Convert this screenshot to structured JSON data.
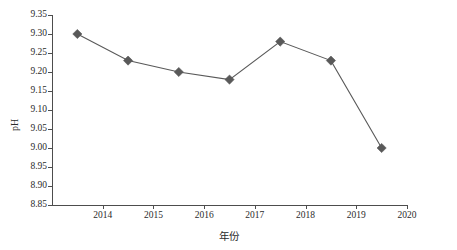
{
  "chart_data": {
    "type": "line",
    "title": "",
    "subtitle": "",
    "xlabel": "年份",
    "ylabel": "pH",
    "x": [
      2013.5,
      2014.5,
      2015.5,
      2016.5,
      2017.5,
      2018.5,
      2019.5
    ],
    "values": [
      9.3,
      9.23,
      9.2,
      9.18,
      9.28,
      9.23,
      9.0
    ],
    "series": [
      {
        "name": "pH",
        "values": [
          9.3,
          9.23,
          9.2,
          9.18,
          9.28,
          9.23,
          9.0
        ]
      }
    ],
    "xlim": [
      2013.0,
      2020.0
    ],
    "ylim": [
      8.85,
      9.35
    ],
    "xticks": [
      2014,
      2015,
      2016,
      2017,
      2018,
      2019,
      2020
    ],
    "xtick_labels": [
      "2014",
      "2015",
      "2016",
      "2017",
      "2018",
      "2019",
      "2020"
    ],
    "yticks": [
      8.85,
      8.9,
      8.95,
      9.0,
      9.05,
      9.1,
      9.15,
      9.2,
      9.25,
      9.3,
      9.35
    ],
    "ytick_labels": [
      "8.85",
      "8.90",
      "8.95",
      "9.00",
      "9.05",
      "9.10",
      "9.15",
      "9.20",
      "9.25",
      "9.30",
      "9.35"
    ],
    "grid": false,
    "legend": false,
    "legend_position": "none",
    "marker": "diamond",
    "colors": {
      "line": "#595959",
      "marker": "#595959",
      "axis": "#4d4d4d",
      "text": "#2b2b2b",
      "background": "#ffffff"
    }
  }
}
